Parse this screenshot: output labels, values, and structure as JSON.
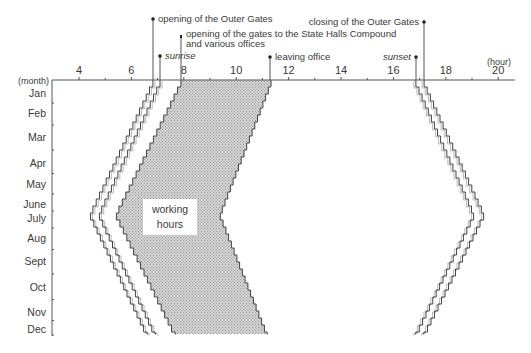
{
  "chart_data": {
    "type": "area",
    "title": "",
    "xlabel": "(hour)",
    "ylabel": "(month)",
    "x_ticks": [
      4,
      6,
      8,
      10,
      12,
      14,
      16,
      18,
      20
    ],
    "x_minor_ticks": [
      5,
      7,
      9,
      11,
      13,
      15,
      17,
      19
    ],
    "xlim": [
      3,
      21
    ],
    "months": [
      "Jan",
      "Feb",
      "Mar",
      "Apr",
      "May",
      "June",
      "July",
      "Aug",
      "Sept",
      "Oct",
      "Nov",
      "Dec"
    ],
    "grid": false,
    "series": [
      {
        "name": "opening of the Outer Gates",
        "style": "line",
        "values_at": {
          "start": 6.82,
          "midsummer": 4.42,
          "end": 6.63
        }
      },
      {
        "name": "sunrise",
        "style": "line",
        "italic": true,
        "values_at": {
          "start": 7.09,
          "midsummer": 4.76,
          "end": 6.94
        }
      },
      {
        "name": "opening of the gates to the State Halls Compound and various offices",
        "style": "fill-left-edge",
        "values_at": {
          "start": 7.89,
          "midsummer": 5.41,
          "end": 7.7
        }
      },
      {
        "name": "leaving office",
        "style": "fill-right-edge",
        "values_at": {
          "start": 11.33,
          "midsummer": 9.38,
          "end": 11.21
        }
      },
      {
        "name": "sunset",
        "style": "line",
        "italic": true,
        "values_at": {
          "start": 16.86,
          "midsummer": 19.08,
          "end": 16.82
        }
      },
      {
        "name": "closing of the Outer Gates",
        "style": "line",
        "values_at": {
          "start": 17.17,
          "midsummer": 19.46,
          "end": 17.13
        }
      }
    ],
    "filled_region": {
      "label": "working hours",
      "between": [
        "opening of the gates to the State Halls Compound and various offices",
        "leaving office"
      ],
      "color": "#c8c8c8"
    },
    "annotations": [
      {
        "text": "opening of the Outer Gates",
        "x_hour": 6.82
      },
      {
        "text": "opening of the gates to the State Halls Compound",
        "text2": "and various offices",
        "x_hour": 7.89
      },
      {
        "text": "sunrise",
        "x_hour": 7.09,
        "italic": true
      },
      {
        "text": "leaving office",
        "x_hour": 11.33
      },
      {
        "text": "sunset",
        "x_hour": 16.86,
        "italic": true
      },
      {
        "text": "closing of the Outer Gates",
        "x_hour": 17.17
      }
    ]
  },
  "labels": {
    "month_unit": "(month)",
    "hour_unit": "(hour)",
    "working_1": "working",
    "working_2": "hours",
    "ann_outer_open": "opening of the Outer Gates",
    "ann_gates_1": "opening of the gates to the State Halls Compound",
    "ann_gates_2": "and various offices",
    "ann_sunrise": "sunrise",
    "ann_leaving": "leaving office",
    "ann_sunset": "sunset",
    "ann_outer_close": "closing of the Outer Gates"
  },
  "colors": {
    "fill": "#c4c4c4",
    "line": "#444444"
  }
}
